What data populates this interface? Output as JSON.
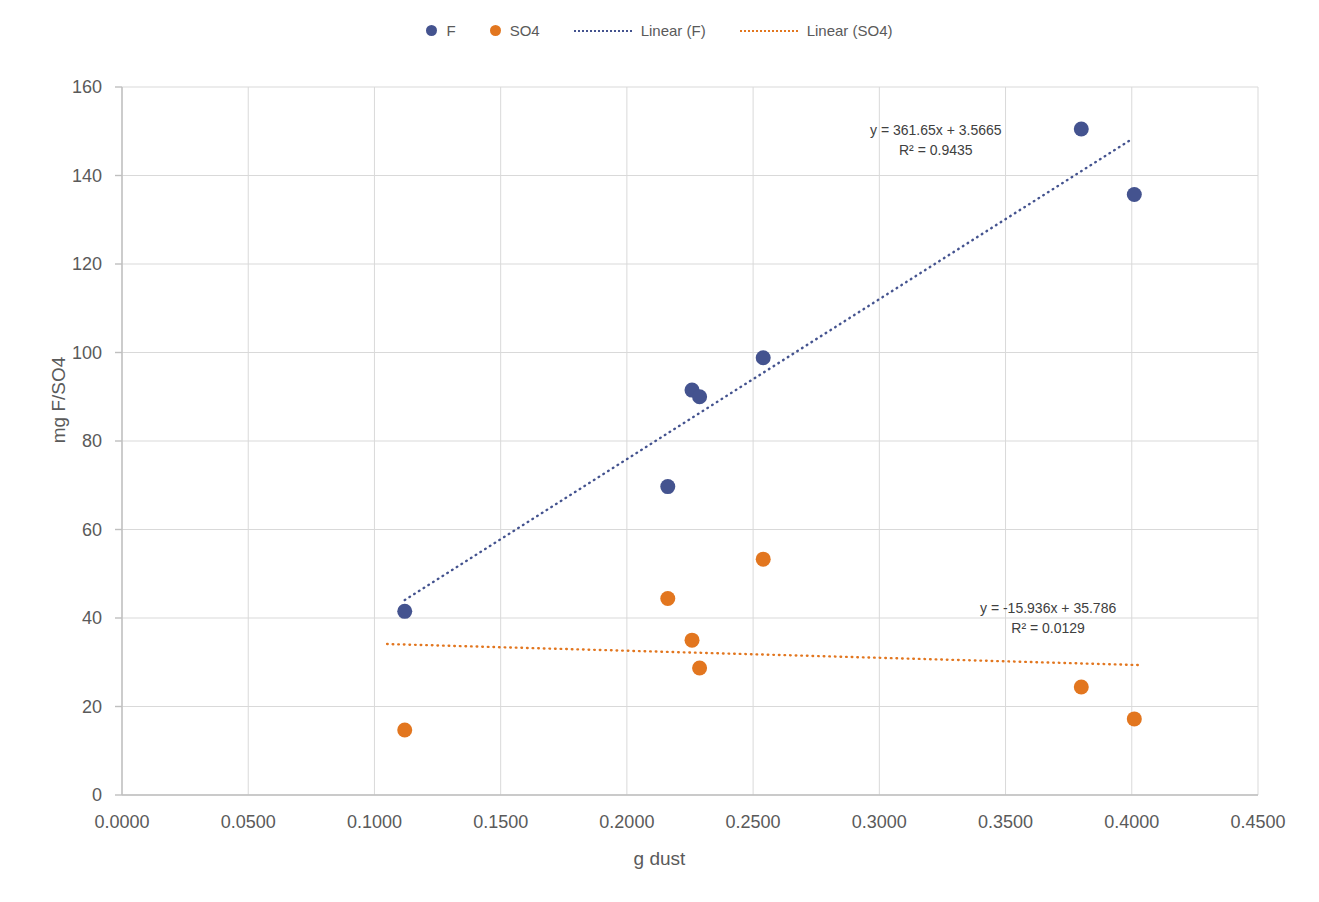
{
  "chart_data": {
    "type": "scatter",
    "title": "",
    "xlabel": "g dust",
    "ylabel": "mg F/SO4",
    "xlim": [
      0.0,
      0.45
    ],
    "ylim": [
      0,
      160
    ],
    "grid": true,
    "legend_position": "top-center",
    "xticks": [
      "0.0000",
      "0.0500",
      "0.1000",
      "0.1500",
      "0.2000",
      "0.2500",
      "0.3000",
      "0.3500",
      "0.4000",
      "0.4500"
    ],
    "yticks": [
      "0",
      "20",
      "40",
      "60",
      "80",
      "100",
      "120",
      "140",
      "160"
    ],
    "colors": {
      "F": "#44538f",
      "SO4": "#e2761f",
      "grid": "#d9d9d9",
      "axis": "#bfbfbf",
      "text": "#5a5a5a"
    },
    "series": [
      {
        "name": "F",
        "color": "#44538f",
        "points": [
          {
            "x": 0.112,
            "y": 41.5
          },
          {
            "x": 0.2162,
            "y": 69.7
          },
          {
            "x": 0.2258,
            "y": 91.5
          },
          {
            "x": 0.2288,
            "y": 90.0
          },
          {
            "x": 0.254,
            "y": 98.8
          },
          {
            "x": 0.38,
            "y": 150.5
          },
          {
            "x": 0.401,
            "y": 135.7
          }
        ]
      },
      {
        "name": "SO4",
        "color": "#e2761f",
        "points": [
          {
            "x": 0.112,
            "y": 14.7
          },
          {
            "x": 0.2162,
            "y": 44.4
          },
          {
            "x": 0.2258,
            "y": 35.0
          },
          {
            "x": 0.2288,
            "y": 28.7
          },
          {
            "x": 0.254,
            "y": 53.3
          },
          {
            "x": 0.38,
            "y": 24.4
          },
          {
            "x": 0.401,
            "y": 17.2
          }
        ]
      }
    ],
    "trendlines": [
      {
        "name": "Linear (F)",
        "color": "#44538f",
        "slope": 361.65,
        "intercept": 3.5665,
        "r2": 0.9435,
        "equation": "y = 361.65x + 3.5665",
        "r2_label": "R² = 0.9435",
        "x_start": 0.112,
        "x_end": 0.4
      },
      {
        "name": "Linear (SO4)",
        "color": "#e2761f",
        "slope": -15.936,
        "intercept": 35.786,
        "r2": 0.0129,
        "equation": "y = -15.936x + 35.786",
        "r2_label": "R² = 0.0129",
        "x_start": 0.105,
        "x_end": 0.403
      }
    ],
    "annotations": [
      {
        "id": "eq-f",
        "text": "y = 361.65x + 3.5665",
        "text2": "R² = 0.9435",
        "left": 870,
        "top": 120
      },
      {
        "id": "eq-so4",
        "text": "y = -15.936x + 35.786",
        "text2": "R² = 0.0129",
        "left": 980,
        "top": 598
      }
    ]
  },
  "legend": {
    "items": [
      {
        "label": "F",
        "marker": "dot",
        "color": "#44538f"
      },
      {
        "label": "SO4",
        "marker": "dot",
        "color": "#e2761f"
      },
      {
        "label": "Linear (F)",
        "marker": "dotted-line",
        "color": "#44538f"
      },
      {
        "label": "Linear (SO4)",
        "marker": "dotted-line",
        "color": "#e2761f"
      }
    ]
  }
}
